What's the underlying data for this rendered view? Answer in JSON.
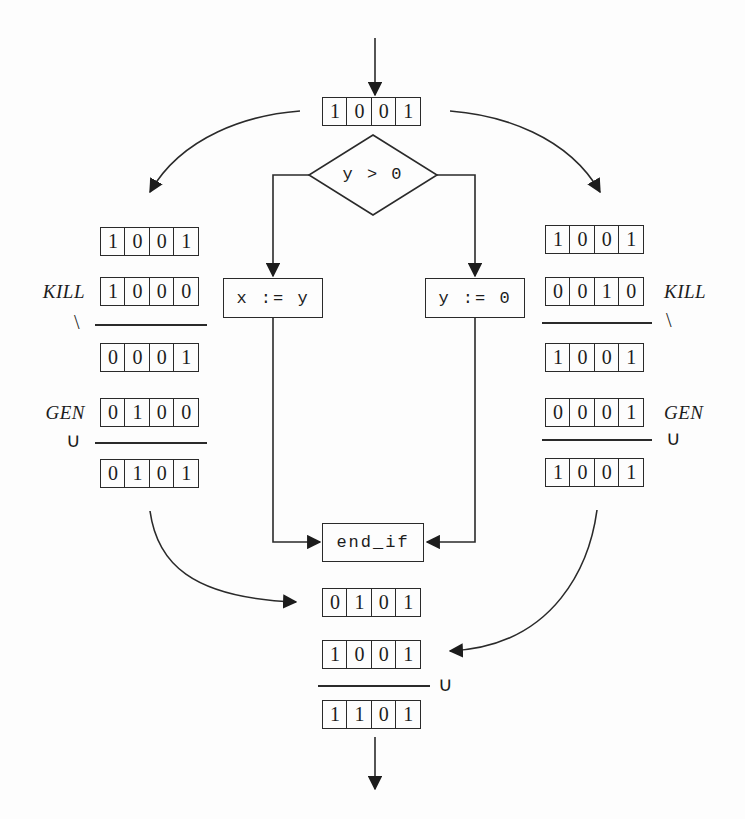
{
  "diagram": {
    "condition": "y > 0",
    "entry_vector": "1001",
    "ops": {
      "difference": "\\",
      "union": "∪"
    },
    "left": {
      "in_vector": "1001",
      "kill_label": "KILL",
      "kill_vector": "1000",
      "after_kill_vector": "0001",
      "gen_label": "GEN",
      "gen_vector": "0100",
      "out_vector": "0101",
      "statement": "x := y"
    },
    "right": {
      "in_vector": "1001",
      "kill_label": "KILL",
      "kill_vector": "0010",
      "after_kill_vector": "1001",
      "gen_label": "GEN",
      "gen_vector": "0001",
      "out_vector": "1001",
      "statement": "y := 0"
    },
    "join": {
      "label": "end_if",
      "left_in_vector": "0101",
      "right_in_vector": "1001",
      "out_vector": "1101"
    }
  }
}
